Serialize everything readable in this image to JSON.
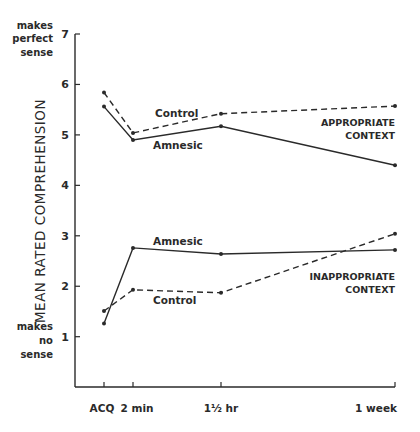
{
  "chart_data": {
    "type": "line",
    "title": "",
    "xlabel": "",
    "ylabel": "MEAN RATED COMPREHENSION",
    "ylim": [
      0,
      7
    ],
    "yticks": [
      1,
      2,
      3,
      4,
      5,
      6,
      7
    ],
    "y_anchor_labels": {
      "top": [
        "makes",
        "perfect",
        "sense"
      ],
      "bottom": [
        "makes",
        "no",
        "sense"
      ]
    },
    "categories": [
      "ACQ",
      "2 min",
      "1½ hr",
      "1 week"
    ],
    "grid": false,
    "legend": "inline labels",
    "panels": [
      {
        "name": "APPROPRIATE CONTEXT",
        "label_lines": [
          "APPROPRIATE",
          "CONTEXT"
        ],
        "series": [
          {
            "name": "Control",
            "style": "dashed",
            "values": [
              5.84,
              5.04,
              5.42,
              5.57
            ]
          },
          {
            "name": "Amnesic",
            "style": "solid",
            "values": [
              5.56,
              4.9,
              5.17,
              4.4
            ]
          }
        ]
      },
      {
        "name": "INAPPROPRIATE CONTEXT",
        "label_lines": [
          "INAPPROPRIATE",
          "CONTEXT"
        ],
        "series": [
          {
            "name": "Amnesic",
            "style": "solid",
            "values": [
              1.26,
              2.76,
              2.64,
              2.72
            ]
          },
          {
            "name": "Control",
            "style": "dashed",
            "values": [
              1.51,
              1.93,
              1.87,
              3.04
            ]
          }
        ]
      }
    ]
  },
  "labels": {
    "upper_control": "Control",
    "upper_amnesic": "Amnesic",
    "lower_amnesic": "Amnesic",
    "lower_control": "Control"
  },
  "colors": {
    "ink": "#2a2a2a",
    "background": "#ffffff"
  }
}
